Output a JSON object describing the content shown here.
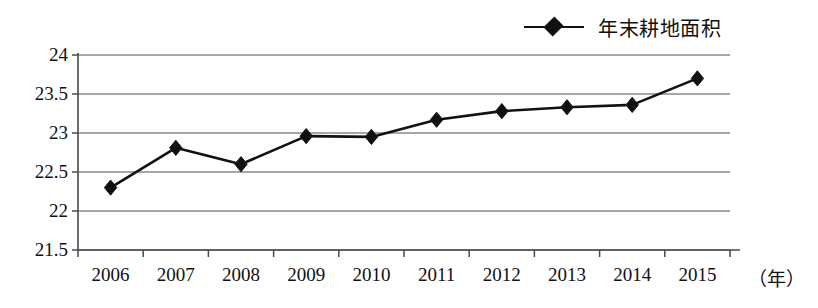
{
  "chart_data": {
    "type": "line",
    "title": "",
    "xlabel": "年",
    "ylabel": "",
    "categories": [
      "2006",
      "2007",
      "2008",
      "2009",
      "2010",
      "2011",
      "2012",
      "2013",
      "2014",
      "2015"
    ],
    "series": [
      {
        "name": "年末耕地面积",
        "values": [
          22.3,
          22.81,
          22.6,
          22.96,
          22.95,
          23.17,
          23.28,
          23.33,
          23.36,
          23.7
        ]
      }
    ],
    "ylim": [
      21.5,
      24
    ],
    "yticks": [
      "21.5",
      "22",
      "22.5",
      "23",
      "23.5",
      "24"
    ],
    "ytick_values": [
      21.5,
      22,
      22.5,
      23,
      23.5,
      24
    ],
    "grid": true,
    "legend_position": "top-right",
    "marker": "diamond",
    "line_color": "#111111",
    "grid_color": "#8a8a8a",
    "axis_color": "#4a4a4a",
    "background": "#ffffff"
  },
  "legend": {
    "entry_label": "年末耕地面积",
    "marker_name": "diamond-marker"
  },
  "axis": {
    "x_unit_text": "（年）"
  }
}
